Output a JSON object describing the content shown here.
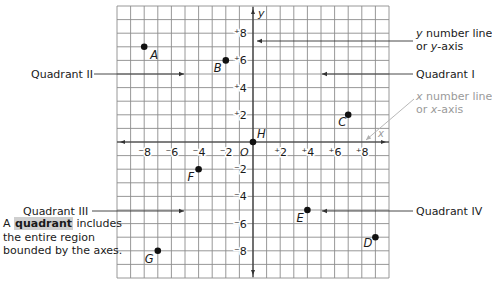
{
  "diagram": {
    "axes": {
      "x_label": "x",
      "y_label": "y",
      "origin_label": "O",
      "x_ticks": [
        {
          "value": -8,
          "label": "⁻8"
        },
        {
          "value": -6,
          "label": "⁻6"
        },
        {
          "value": -4,
          "label": "⁻4"
        },
        {
          "value": -2,
          "label": "⁻2"
        },
        {
          "value": 2,
          "label": "⁺2"
        },
        {
          "value": 4,
          "label": "⁺4"
        },
        {
          "value": 6,
          "label": "⁺6"
        },
        {
          "value": 8,
          "label": "⁺8"
        }
      ],
      "y_ticks": [
        {
          "value": 8,
          "label": "⁺8"
        },
        {
          "value": 6,
          "label": "⁺6"
        },
        {
          "value": 4,
          "label": "⁺4"
        },
        {
          "value": 2,
          "label": "⁺2"
        },
        {
          "value": -2,
          "label": "⁻2"
        },
        {
          "value": -4,
          "label": "⁻4"
        },
        {
          "value": -6,
          "label": "⁻6"
        },
        {
          "value": -8,
          "label": "⁻8"
        }
      ],
      "range": [
        -10,
        10
      ]
    },
    "points": [
      {
        "name": "A",
        "x": -8,
        "y": 7
      },
      {
        "name": "B",
        "x": -2,
        "y": 6
      },
      {
        "name": "C",
        "x": 7,
        "y": 2
      },
      {
        "name": "D",
        "x": 9,
        "y": -7
      },
      {
        "name": "E",
        "x": 4,
        "y": -5
      },
      {
        "name": "F",
        "x": -4,
        "y": -2
      },
      {
        "name": "G",
        "x": -7,
        "y": -8
      },
      {
        "name": "H",
        "x": 0,
        "y": 0
      }
    ],
    "callouts": {
      "quadrant_1": "Quadrant I",
      "quadrant_2": "Quadrant II",
      "quadrant_3": "Quadrant III",
      "quadrant_4": "Quadrant IV",
      "y_axis_line1": "y number line",
      "y_axis_line2": "or y-axis",
      "x_axis_line1": "x number line",
      "x_axis_line2": "or x-axis"
    },
    "note": {
      "prefix": "A",
      "term": "quadrant",
      "rest": "includes the entire region bounded by the axes."
    },
    "colors": {
      "grid": "#8c8c8c",
      "axis": "#333333",
      "text": "#1a1a1a",
      "muted": "#9a9a9a",
      "highlight": "#cfcfcf"
    }
  }
}
